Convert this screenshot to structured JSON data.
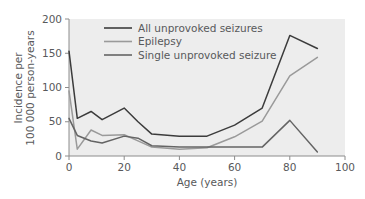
{
  "chart_data": {
    "type": "line",
    "title": "",
    "xlabel": "Age (years)",
    "ylabel": "Incidence per 100 000 person-years",
    "ylabel_line1": "Incidence per",
    "ylabel_line2": "100 000 person-years",
    "xlim": [
      0,
      100
    ],
    "ylim": [
      0,
      200
    ],
    "xticks": [
      0,
      20,
      40,
      60,
      80,
      100
    ],
    "yticks": [
      0,
      50,
      100,
      150,
      200
    ],
    "xtick_labels": [
      "0",
      "20",
      "40",
      "60",
      "80",
      "100"
    ],
    "ytick_labels": [
      "0",
      "50",
      "100",
      "150",
      "200"
    ],
    "grid": false,
    "legend_position": "top-center",
    "plot_background": "#ededed",
    "series": [
      {
        "name": "All unprovoked seizures",
        "color": "#3c3c3c",
        "x": [
          0,
          3,
          8,
          12,
          20,
          25,
          30,
          40,
          50,
          60,
          70,
          80,
          90
        ],
        "values": [
          153,
          55,
          65,
          53,
          70,
          50,
          32,
          29,
          29,
          45,
          70,
          176,
          157
        ]
      },
      {
        "name": "Epilepsy",
        "color": "#9a9a9a",
        "x": [
          0,
          3,
          8,
          12,
          20,
          25,
          30,
          40,
          50,
          60,
          70,
          80,
          90
        ],
        "values": [
          95,
          10,
          38,
          30,
          31,
          22,
          13,
          10,
          12,
          28,
          51,
          117,
          144
        ]
      },
      {
        "name": "Single unprovoked seizure",
        "color": "#646464",
        "x": [
          0,
          3,
          8,
          12,
          20,
          25,
          30,
          40,
          50,
          60,
          70,
          80,
          90
        ],
        "values": [
          55,
          30,
          22,
          19,
          29,
          26,
          15,
          13,
          13,
          13,
          13,
          52,
          6
        ]
      }
    ]
  },
  "legend": {
    "items": [
      {
        "label": "All unprovoked seizures",
        "color": "#3c3c3c"
      },
      {
        "label": "Epilepsy",
        "color": "#9a9a9a"
      },
      {
        "label": "Single unprovoked seizure",
        "color": "#646464"
      }
    ]
  },
  "axes": {
    "x_title": "Age (years)",
    "y_title_line1": "Incidence per",
    "y_title_line2": "100 000 person-years"
  }
}
